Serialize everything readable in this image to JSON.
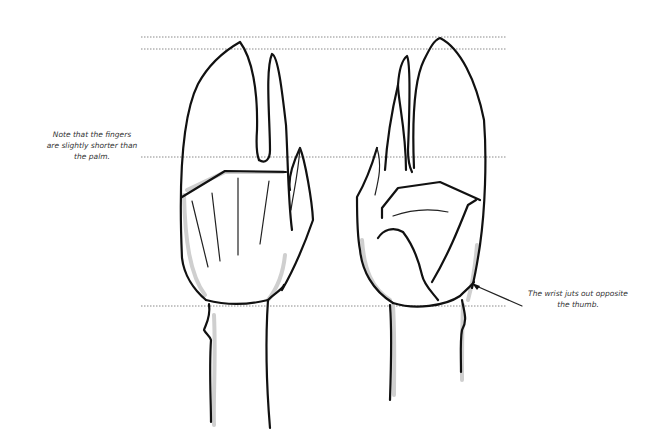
{
  "illustration": {
    "subject": "Two hand drawings (palm and back view) with proportion guide lines",
    "annotations": {
      "left_note": {
        "line1": "Note that the fingers",
        "line2": "are slightly shorter than",
        "line3": "the palm."
      },
      "right_note": {
        "line1": "The wrist juts out opposite",
        "line2": "the thumb."
      }
    },
    "guide_lines_y": [
      37,
      49,
      157,
      306
    ],
    "colors": {
      "background": "#ffffff",
      "ink": "#111111",
      "shading": "#cfcfcf",
      "guide": "#8a8a8a"
    }
  }
}
